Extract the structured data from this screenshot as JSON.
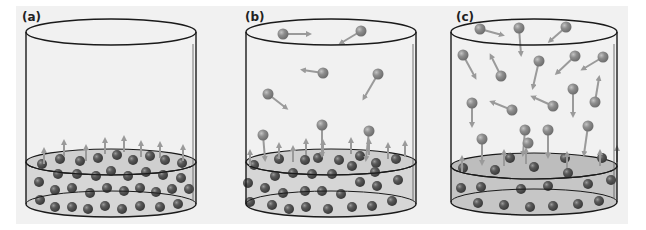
{
  "figure": {
    "colors": {
      "background": "#f1f1f1",
      "liquid": "#d0d0d0",
      "liquid_molecule": "#555555",
      "vapor_molecule": "#8a8a8a",
      "arrow": "#9a9a9a",
      "outline": "#1a1a1a"
    },
    "panels": [
      {
        "label": "(a)",
        "cx": 111,
        "rx": 85,
        "top_y": 32,
        "liquid_y": 162,
        "bottom_y": 204,
        "vapor": [],
        "surface_arrows_up": [
          [
            44,
            150
          ],
          [
            64,
            142
          ],
          [
            86,
            147
          ],
          [
            105,
            140
          ],
          [
            124,
            138
          ],
          [
            141,
            143
          ],
          [
            160,
            144
          ],
          [
            183,
            147
          ]
        ],
        "liquid": [
          [
            42,
            164
          ],
          [
            60,
            159
          ],
          [
            80,
            161
          ],
          [
            98,
            158
          ],
          [
            117,
            155
          ],
          [
            133,
            160
          ],
          [
            150,
            156
          ],
          [
            165,
            160
          ],
          [
            182,
            163
          ],
          [
            58,
            174
          ],
          [
            77,
            174
          ],
          [
            96,
            176
          ],
          [
            111,
            171
          ],
          [
            128,
            176
          ],
          [
            146,
            172
          ],
          [
            163,
            175
          ],
          [
            181,
            178
          ],
          [
            39,
            182
          ],
          [
            55,
            190
          ],
          [
            72,
            188
          ],
          [
            90,
            193
          ],
          [
            107,
            188
          ],
          [
            124,
            191
          ],
          [
            140,
            188
          ],
          [
            156,
            192
          ],
          [
            172,
            189
          ],
          [
            189,
            189
          ],
          [
            40,
            200
          ],
          [
            55,
            207
          ],
          [
            72,
            207
          ],
          [
            88,
            209
          ],
          [
            105,
            206
          ],
          [
            122,
            209
          ],
          [
            140,
            206
          ],
          [
            160,
            207
          ],
          [
            178,
            204
          ]
        ]
      },
      {
        "label": "(b)",
        "cx": 331,
        "rx": 85,
        "top_y": 32,
        "liquid_y": 162,
        "bottom_y": 204,
        "vapor": [
          {
            "x": 283,
            "y": 34,
            "dx": 26,
            "dy": 0
          },
          {
            "x": 361,
            "y": 31,
            "dx": -20,
            "dy": 12
          },
          {
            "x": 323,
            "y": 73,
            "dx": -20,
            "dy": -3
          },
          {
            "x": 378,
            "y": 74,
            "dx": -14,
            "dy": 24
          },
          {
            "x": 268,
            "y": 94,
            "dx": 18,
            "dy": 14
          },
          {
            "x": 322,
            "y": 125,
            "dx": 0,
            "dy": 30
          },
          {
            "x": 263,
            "y": 135,
            "dx": 2,
            "dy": 24
          },
          {
            "x": 369,
            "y": 131,
            "dx": -3,
            "dy": 28
          }
        ],
        "surface_arrows_up": [
          [
            250,
            152
          ],
          [
            279,
            145
          ],
          [
            293,
            148
          ],
          [
            306,
            141
          ],
          [
            323,
            142
          ],
          [
            351,
            140
          ],
          [
            369,
            141
          ],
          [
            388,
            145
          ],
          [
            405,
            143
          ]
        ],
        "liquid": [
          [
            254,
            165
          ],
          [
            279,
            159
          ],
          [
            305,
            160
          ],
          [
            318,
            158
          ],
          [
            339,
            160
          ],
          [
            360,
            156
          ],
          [
            376,
            163
          ],
          [
            396,
            159
          ],
          [
            275,
            176
          ],
          [
            293,
            173
          ],
          [
            312,
            174
          ],
          [
            332,
            174
          ],
          [
            352,
            166
          ],
          [
            375,
            172
          ],
          [
            248,
            183
          ],
          [
            265,
            188
          ],
          [
            283,
            193
          ],
          [
            305,
            191
          ],
          [
            322,
            191
          ],
          [
            341,
            194
          ],
          [
            360,
            182
          ],
          [
            377,
            186
          ],
          [
            398,
            180
          ],
          [
            250,
            202
          ],
          [
            272,
            205
          ],
          [
            289,
            209
          ],
          [
            306,
            207
          ],
          [
            328,
            209
          ],
          [
            352,
            207
          ],
          [
            372,
            206
          ],
          [
            392,
            201
          ]
        ]
      },
      {
        "label": "(c)",
        "cx": 534,
        "rx": 83,
        "top_y": 32,
        "liquid_y": 166,
        "bottom_y": 202,
        "vapor": [
          {
            "x": 480,
            "y": 29,
            "dx": 22,
            "dy": 6
          },
          {
            "x": 519,
            "y": 28,
            "dx": 2,
            "dy": 26
          },
          {
            "x": 566,
            "y": 27,
            "dx": -16,
            "dy": 14
          },
          {
            "x": 463,
            "y": 55,
            "dx": 12,
            "dy": 22
          },
          {
            "x": 501,
            "y": 76,
            "dx": -10,
            "dy": -20
          },
          {
            "x": 539,
            "y": 61,
            "dx": -6,
            "dy": 26
          },
          {
            "x": 575,
            "y": 56,
            "dx": -18,
            "dy": 17
          },
          {
            "x": 603,
            "y": 57,
            "dx": -20,
            "dy": 12
          },
          {
            "x": 472,
            "y": 103,
            "dx": 0,
            "dy": 22
          },
          {
            "x": 512,
            "y": 110,
            "dx": -20,
            "dy": -8
          },
          {
            "x": 553,
            "y": 106,
            "dx": -20,
            "dy": -9
          },
          {
            "x": 573,
            "y": 89,
            "dx": 0,
            "dy": 26
          },
          {
            "x": 595,
            "y": 102,
            "dx": 4,
            "dy": -24
          },
          {
            "x": 482,
            "y": 139,
            "dx": 0,
            "dy": 24
          },
          {
            "x": 525,
            "y": 130,
            "dx": -2,
            "dy": 24
          },
          {
            "x": 548,
            "y": 130,
            "dx": 0,
            "dy": 26
          },
          {
            "x": 588,
            "y": 126,
            "dx": -4,
            "dy": 28
          },
          {
            "x": 528,
            "y": 143,
            "dx": 0,
            "dy": 0
          }
        ],
        "surface_arrows_up": [
          [
            462,
            158
          ],
          [
            504,
            152
          ],
          [
            526,
            150
          ],
          [
            567,
            154
          ],
          [
            600,
            152
          ],
          [
            617,
            148
          ]
        ],
        "liquid": [
          [
            463,
            168
          ],
          [
            510,
            158
          ],
          [
            495,
            170
          ],
          [
            534,
            167
          ],
          [
            565,
            158
          ],
          [
            568,
            173
          ],
          [
            602,
            158
          ],
          [
            461,
            188
          ],
          [
            481,
            187
          ],
          [
            521,
            189
          ],
          [
            548,
            186
          ],
          [
            588,
            184
          ],
          [
            611,
            180
          ],
          [
            478,
            203
          ],
          [
            504,
            205
          ],
          [
            530,
            207
          ],
          [
            553,
            206
          ],
          [
            578,
            204
          ],
          [
            599,
            201
          ]
        ]
      }
    ]
  }
}
